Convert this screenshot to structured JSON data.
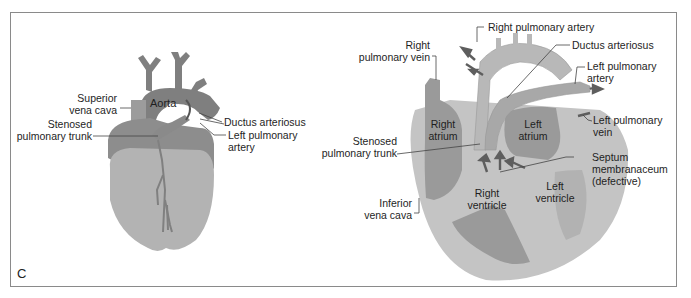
{
  "figure": {
    "panel_letter": "C",
    "colors": {
      "frame": "#8a8a8a",
      "vessel_dark": "#7f7f7f",
      "tissue_mid": "#9a9a9a",
      "tissue_light": "#b9b9b9",
      "muscle_outer": "#c4c4c4",
      "label_text": "#1e1e1e"
    }
  },
  "external_view": {
    "labels": {
      "aorta": "Aorta",
      "superior_vena_cava": [
        "Superior",
        "vena cava"
      ],
      "stenosed_pulmonary_trunk": [
        "Stenosed",
        "pulmonary trunk"
      ],
      "ductus_arteriosus": "Ductus arteriosus",
      "left_pulmonary_artery": [
        "Left pulmonary",
        "artery"
      ]
    }
  },
  "section_view": {
    "labels": {
      "right_pulmonary_artery": "Right pulmonary artery",
      "right_pulmonary_vein": [
        "Right",
        "pulmonary vein"
      ],
      "ductus_arteriosus": "Ductus arteriosus",
      "left_pulmonary_artery": [
        "Left pulmonary",
        "artery"
      ],
      "left_pulmonary_vein": [
        "Left pulmonary",
        "vein"
      ],
      "right_atrium": [
        "Right",
        "atrium"
      ],
      "left_atrium": [
        "Left",
        "atrium"
      ],
      "stenosed_pulmonary_trunk": [
        "Stenosed",
        "pulmonary trunk"
      ],
      "septum_membranaceum": [
        "Septum",
        "membranaceum",
        "(defective)"
      ],
      "right_ventricle": [
        "Right",
        "ventricle"
      ],
      "left_ventricle": [
        "Left",
        "ventricle"
      ],
      "inferior_vena_cava": [
        "Inferior",
        "vena cava"
      ]
    }
  }
}
